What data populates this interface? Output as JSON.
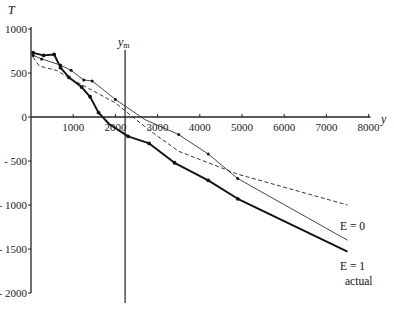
{
  "chart_data": {
    "type": "line",
    "title": "",
    "xlabel": "y",
    "ylabel": "T",
    "xlim": [
      0,
      8000
    ],
    "ylim": [
      -2000,
      1000
    ],
    "x_ticks": [
      1000,
      2000,
      3000,
      4000,
      5000,
      6000,
      7000,
      8000
    ],
    "y_ticks": [
      1000,
      500,
      0,
      -500,
      -1000,
      -1500,
      -2000
    ],
    "x_tick_labels": [
      "1000",
      "2000",
      "3000",
      "4000",
      "5000",
      "6000",
      "7000",
      "8000"
    ],
    "y_tick_labels": [
      "1000",
      "500",
      "0",
      "- 500",
      "- 1000",
      "- 1500",
      "- 2000"
    ],
    "grid": false,
    "annotations": [
      {
        "text": "y_m",
        "label": "ym",
        "x": 2230,
        "type": "vertical-line"
      }
    ],
    "series": [
      {
        "name": "actual",
        "style": "thick-solid-markers",
        "points": [
          [
            50,
            730
          ],
          [
            300,
            700
          ],
          [
            550,
            710
          ],
          [
            700,
            560
          ],
          [
            900,
            450
          ],
          [
            1200,
            340
          ],
          [
            1400,
            230
          ],
          [
            1600,
            50
          ],
          [
            1850,
            -80
          ],
          [
            2300,
            -220
          ],
          [
            2800,
            -300
          ],
          [
            3400,
            -520
          ],
          [
            4200,
            -720
          ],
          [
            4900,
            -930
          ],
          [
            7500,
            -1530
          ]
        ],
        "markers": [
          [
            50,
            730
          ],
          [
            300,
            700
          ],
          [
            550,
            710
          ],
          [
            700,
            560
          ],
          [
            900,
            450
          ],
          [
            1200,
            340
          ],
          [
            1400,
            230
          ],
          [
            1600,
            50
          ],
          [
            2300,
            -220
          ],
          [
            2800,
            -300
          ],
          [
            3400,
            -520
          ],
          [
            4200,
            -720
          ],
          [
            4900,
            -930
          ]
        ]
      },
      {
        "name": "E = 1",
        "style": "thin-solid-markers",
        "points": [
          [
            50,
            700
          ],
          [
            250,
            660
          ],
          [
            700,
            590
          ],
          [
            950,
            530
          ],
          [
            1250,
            420
          ],
          [
            1450,
            410
          ],
          [
            2000,
            200
          ],
          [
            2700,
            -30
          ],
          [
            3500,
            -200
          ],
          [
            4200,
            -420
          ],
          [
            4900,
            -700
          ],
          [
            7500,
            -1400
          ]
        ],
        "markers": [
          [
            50,
            700
          ],
          [
            250,
            660
          ],
          [
            700,
            590
          ],
          [
            950,
            530
          ],
          [
            1250,
            420
          ],
          [
            1450,
            410
          ],
          [
            2000,
            200
          ],
          [
            3500,
            -200
          ],
          [
            4200,
            -420
          ],
          [
            4900,
            -700
          ]
        ]
      },
      {
        "name": "E = 0",
        "style": "dashed",
        "points": [
          [
            50,
            680
          ],
          [
            200,
            580
          ],
          [
            600,
            530
          ],
          [
            1000,
            420
          ],
          [
            2000,
            160
          ],
          [
            2800,
            -150
          ],
          [
            3500,
            -390
          ],
          [
            4900,
            -650
          ],
          [
            7500,
            -1000
          ]
        ],
        "markers": []
      }
    ]
  },
  "labels": {
    "y_axis_title": "T",
    "x_axis_title": "y",
    "ym_label": "y",
    "ym_sub": "m",
    "series_e0": "E = 0",
    "series_e1": "E = 1",
    "series_actual": "actual"
  }
}
